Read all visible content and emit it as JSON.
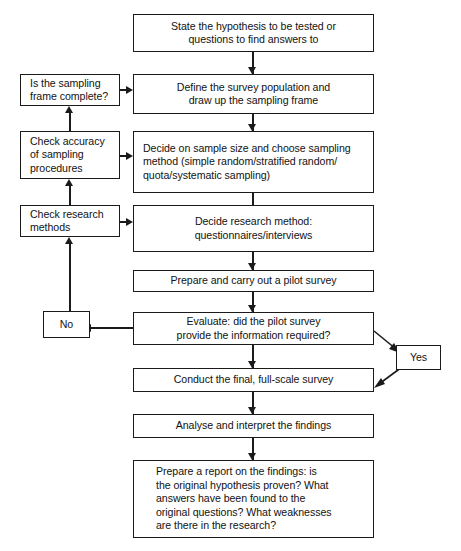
{
  "diagram": {
    "colors": {
      "stroke": "#1b1b1b",
      "fill": "#ffffff",
      "text": "#121212"
    },
    "nodes": {
      "hypothesis": {
        "lines": [
          "State the hypothesis to be tested or",
          "questions to find answers to"
        ]
      },
      "define_population": {
        "lines": [
          "Define the survey population and",
          "draw up the sampling frame"
        ]
      },
      "sample_size": {
        "lines": [
          "Decide on sample size and choose sampling",
          "method (simple random/stratified random/",
          "quota/systematic sampling)"
        ]
      },
      "research_method": {
        "lines": [
          "Decide research method:",
          "questionnaires/interviews"
        ]
      },
      "pilot_survey": {
        "lines": [
          "Prepare and carry out a pilot survey"
        ]
      },
      "evaluate": {
        "lines": [
          "Evaluate: did the pilot survey",
          "provide the information required?"
        ]
      },
      "full_survey": {
        "lines": [
          "Conduct the final, full-scale survey"
        ]
      },
      "analyse": {
        "lines": [
          "Analyse and interpret the findings"
        ]
      },
      "report": {
        "lines": [
          "Prepare a report on the findings: is",
          "the original hypothesis proven? What",
          "answers have been found to the",
          "original questions? What weaknesses",
          "are there in the research?"
        ]
      },
      "sampling_frame_check": {
        "lines": [
          "Is the sampling",
          "frame complete?"
        ]
      },
      "accuracy_check": {
        "lines": [
          "Check accuracy",
          "of sampling",
          "procedures"
        ]
      },
      "methods_check": {
        "lines": [
          "Check research",
          "methods"
        ]
      },
      "decision_no": {
        "lines": [
          "No"
        ]
      },
      "decision_yes": {
        "lines": [
          "Yes"
        ]
      }
    }
  }
}
